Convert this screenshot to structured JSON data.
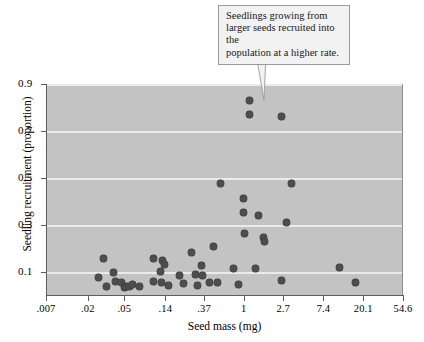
{
  "chart_data": {
    "type": "scatter",
    "title": "",
    "xlabel": "Seed mass (mg)",
    "ylabel": "Seedling recruitment (proportion)",
    "x_scale": "log",
    "x_ticks": [
      ".007",
      ".02",
      ".05",
      ".14",
      ".37",
      "1",
      "2.7",
      "7.4",
      "20.1",
      "54.6"
    ],
    "x_tick_values": [
      0.007,
      0.02,
      0.05,
      0.14,
      0.37,
      1,
      2.7,
      7.4,
      20.1,
      54.6
    ],
    "y_ticks": [
      "0.9",
      "0.7",
      "0.5",
      "0.3",
      "0.1"
    ],
    "y_tick_values": [
      0.9,
      0.7,
      0.5,
      0.3,
      0.1
    ],
    "ylim": [
      0.0,
      0.9
    ],
    "xlim": [
      0.007,
      54.6
    ],
    "grid": true,
    "legend": "none",
    "marker_color": "#4d4d4d",
    "plot_background": "#c3c3c3",
    "gridline_color": "#eceaea",
    "points": [
      {
        "x": 0.03,
        "y": 0.155
      },
      {
        "x": 0.026,
        "y": 0.073
      },
      {
        "x": 0.038,
        "y": 0.095
      },
      {
        "x": 0.032,
        "y": 0.037
      },
      {
        "x": 0.04,
        "y": 0.056
      },
      {
        "x": 0.047,
        "y": 0.053
      },
      {
        "x": 0.05,
        "y": 0.034
      },
      {
        "x": 0.053,
        "y": 0.036
      },
      {
        "x": 0.057,
        "y": 0.038
      },
      {
        "x": 0.062,
        "y": 0.043
      },
      {
        "x": 0.073,
        "y": 0.036
      },
      {
        "x": 0.105,
        "y": 0.157
      },
      {
        "x": 0.105,
        "y": 0.057
      },
      {
        "x": 0.125,
        "y": 0.1
      },
      {
        "x": 0.127,
        "y": 0.055
      },
      {
        "x": 0.132,
        "y": 0.148
      },
      {
        "x": 0.137,
        "y": 0.13
      },
      {
        "x": 0.15,
        "y": 0.042
      },
      {
        "x": 0.2,
        "y": 0.083
      },
      {
        "x": 0.22,
        "y": 0.048
      },
      {
        "x": 0.27,
        "y": 0.183
      },
      {
        "x": 0.3,
        "y": 0.088
      },
      {
        "x": 0.31,
        "y": 0.039
      },
      {
        "x": 0.345,
        "y": 0.125
      },
      {
        "x": 0.36,
        "y": 0.082
      },
      {
        "x": 0.42,
        "y": 0.053
      },
      {
        "x": 0.47,
        "y": 0.208
      },
      {
        "x": 0.52,
        "y": 0.054
      },
      {
        "x": 0.56,
        "y": 0.475
      },
      {
        "x": 0.78,
        "y": 0.113
      },
      {
        "x": 0.87,
        "y": 0.043
      },
      {
        "x": 1.0,
        "y": 0.352
      },
      {
        "x": 1.0,
        "y": 0.412
      },
      {
        "x": 1.02,
        "y": 0.264
      },
      {
        "x": 1.15,
        "y": 0.828
      },
      {
        "x": 1.17,
        "y": 0.768
      },
      {
        "x": 1.35,
        "y": 0.113
      },
      {
        "x": 1.45,
        "y": 0.338
      },
      {
        "x": 1.65,
        "y": 0.245
      },
      {
        "x": 1.7,
        "y": 0.228
      },
      {
        "x": 2.6,
        "y": 0.763
      },
      {
        "x": 2.6,
        "y": 0.06
      },
      {
        "x": 2.9,
        "y": 0.31
      },
      {
        "x": 3.3,
        "y": 0.474
      },
      {
        "x": 11.0,
        "y": 0.117
      },
      {
        "x": 16.5,
        "y": 0.053
      }
    ]
  },
  "callout": {
    "line1": "Seedlings growing from",
    "line2": "larger seeds recruited into the",
    "line3": "population at a higher rate."
  }
}
